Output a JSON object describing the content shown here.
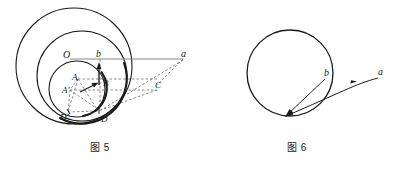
{
  "figure5": {
    "caption": "图 5",
    "labels": {
      "center": "O",
      "b": "b",
      "a": "a",
      "A": "A",
      "A_prime": "A'",
      "B": "B",
      "C": "C",
      "D": "D",
      "D_prime": "D'"
    },
    "colors": {
      "stroke": "#1a1a1a",
      "dashed": "#4d4d4d",
      "thin": "#555555"
    }
  },
  "figure6": {
    "caption": "图 6",
    "labels": {
      "b": "b",
      "a": "a"
    },
    "colors": {
      "stroke": "#1a1a1a"
    }
  }
}
